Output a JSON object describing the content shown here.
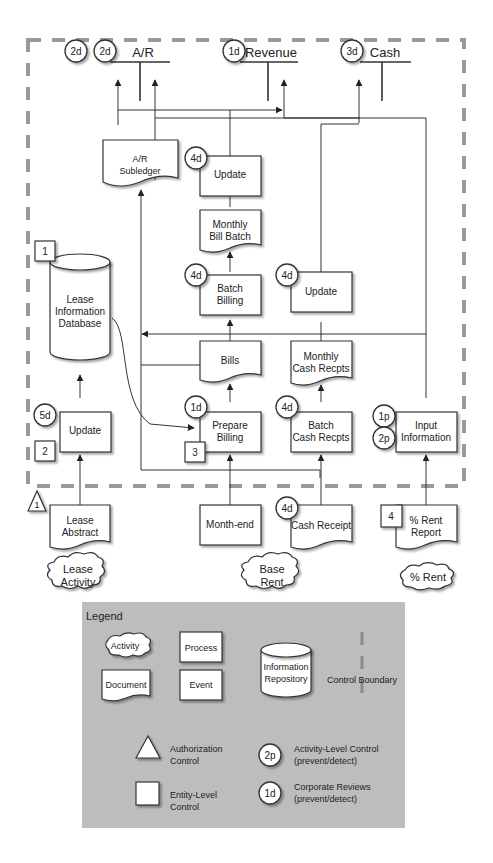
{
  "accounts": [
    {
      "label": "A/R",
      "badges": [
        "2d",
        "2d"
      ]
    },
    {
      "label": "Revenue",
      "badges": [
        "1d"
      ]
    },
    {
      "label": "Cash",
      "badges": [
        "3d"
      ]
    }
  ],
  "documents": {
    "ar_subledger": [
      "A/R",
      "Subledger"
    ],
    "monthly_bill_batch": [
      "Monthly",
      "Bill Batch"
    ],
    "bills": [
      "Bills"
    ],
    "monthly_cash_recpts": [
      "Monthly",
      "Cash Recpts"
    ],
    "lease_abstract": [
      "Lease",
      "Abstract"
    ],
    "cash_receipt": [
      "Cash Receipt"
    ],
    "pct_rent_report": [
      "% Rent",
      "Report"
    ]
  },
  "processes": {
    "update_top": {
      "label": [
        "Update"
      ],
      "badge": "4d"
    },
    "batch_billing": {
      "label": [
        "Batch",
        "Billing"
      ],
      "badge": "4d"
    },
    "update_cash": {
      "label": [
        "Update"
      ],
      "badge": "4d"
    },
    "update_lease": {
      "label": [
        "Update"
      ],
      "badge": "5d",
      "entity": "2"
    },
    "prepare_billing": {
      "label": [
        "Prepare",
        "Billing"
      ],
      "badge": "1d",
      "entity": "3"
    },
    "batch_cash_recpts": {
      "label": [
        "Batch",
        "Cash Recpts"
      ],
      "badge": "4d"
    },
    "input_information": {
      "label": [
        "Input",
        "Information"
      ],
      "badges": [
        "1p",
        "2p"
      ]
    }
  },
  "repository": {
    "label": [
      "Lease",
      "Information",
      "Database"
    ],
    "entity": "1"
  },
  "events": {
    "month_end": "Month-end"
  },
  "external_docs": {
    "cash_receipt_badge": "4d",
    "pct_rent_entity": "4",
    "lease_abstract_auth": "1"
  },
  "activities": {
    "lease_activity": [
      "Lease",
      "Activity"
    ],
    "base_rent": [
      "Base",
      "Rent"
    ],
    "pct_rent": [
      "% Rent"
    ]
  },
  "legend": {
    "title": "Legend",
    "activity": "Activity",
    "process": "Process",
    "document": "Document",
    "event": "Event",
    "repository": [
      "Information",
      "Repository"
    ],
    "control_boundary": "Control Boundary",
    "authorization": [
      "Authorization",
      "Control"
    ],
    "entity_level": [
      "Entity-Level",
      "Control"
    ],
    "activity_level": [
      "Activity-Level Control",
      "(prevent/detect)"
    ],
    "activity_level_badge": "2p",
    "corporate_reviews": [
      "Corporate Reviews",
      "(prevent/detect)"
    ],
    "corporate_reviews_badge": "1d"
  },
  "colors": {
    "legend_bg": "#bdbdbd",
    "boundary": "#999999",
    "line": "#333333"
  }
}
